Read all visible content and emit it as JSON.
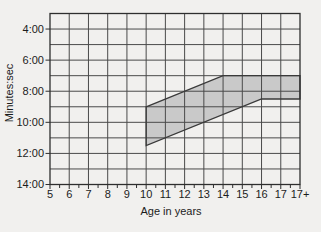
{
  "colors": {
    "background": "#f1f0ee",
    "grid_line": "#4a4a4a",
    "border": "#2e2e2e",
    "band_fill": "#c9c9c9",
    "band_stroke": "#3a3a3a",
    "tick": "#2e2e2e",
    "text": "#1c1c1c"
  },
  "chart_data": {
    "type": "area",
    "title": "",
    "xlabel": "Age in years",
    "ylabel": "Minutes:sec",
    "grid": true,
    "legend": null,
    "x_domain": [
      5,
      18
    ],
    "y_domain": [
      "3:00",
      "14:00"
    ],
    "x_ticks": [
      {
        "label": "5",
        "x": 5
      },
      {
        "label": "6",
        "x": 6
      },
      {
        "label": "7",
        "x": 7
      },
      {
        "label": "8",
        "x": 8
      },
      {
        "label": "9",
        "x": 9
      },
      {
        "label": "10",
        "x": 10
      },
      {
        "label": "11",
        "x": 11
      },
      {
        "label": "12",
        "x": 12
      },
      {
        "label": "13",
        "x": 13
      },
      {
        "label": "14",
        "x": 14
      },
      {
        "label": "15",
        "x": 15
      },
      {
        "label": "16",
        "x": 16
      },
      {
        "label": "17",
        "x": 17
      },
      {
        "label": "17+",
        "x": 18
      }
    ],
    "x_minor_ticks": [
      5.5,
      6.5,
      7.5,
      8.5,
      9.5,
      10.5,
      11.5,
      12.5,
      13.5,
      14.5,
      15.5,
      16.5,
      17.5
    ],
    "x_gridlines": [
      6,
      7,
      8,
      9,
      10,
      11,
      12,
      13,
      14,
      15,
      16,
      17
    ],
    "y_ticks": [
      {
        "label": "4:00",
        "t": "4:00"
      },
      {
        "label": "6:00",
        "t": "6:00"
      },
      {
        "label": "8:00",
        "t": "8:00"
      },
      {
        "label": "10:00",
        "t": "10:00"
      },
      {
        "label": "12:00",
        "t": "12:00"
      },
      {
        "label": "14:00",
        "t": "14:00"
      }
    ],
    "y_gridlines": [
      "4:00",
      "5:00",
      "6:00",
      "7:00",
      "8:00",
      "9:00",
      "10:00",
      "11:00",
      "12:00",
      "13:00"
    ],
    "band": {
      "upper": [
        {
          "x": 10,
          "t": "9:00"
        },
        {
          "x": 14,
          "t": "7:00"
        },
        {
          "x": 18,
          "t": "7:00"
        }
      ],
      "lower": [
        {
          "x": 10,
          "t": "11:30"
        },
        {
          "x": 16,
          "t": "8:30"
        },
        {
          "x": 18,
          "t": "8:30"
        }
      ]
    }
  }
}
